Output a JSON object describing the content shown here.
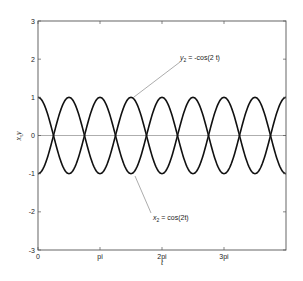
{
  "chart_data": {
    "type": "line",
    "title": "",
    "xlabel": "t",
    "ylabel": "x,y",
    "xlim": [
      0,
      12.566
    ],
    "ylim": [
      -3,
      3
    ],
    "grid": false,
    "legend": null,
    "x_ticks": [
      {
        "value": 0,
        "label": "0"
      },
      {
        "value": 3.1416,
        "label": "pi"
      },
      {
        "value": 6.2832,
        "label": "2pi"
      },
      {
        "value": 9.4248,
        "label": "3pi"
      }
    ],
    "y_ticks": [
      {
        "value": 3,
        "label": "3"
      },
      {
        "value": 2,
        "label": "2"
      },
      {
        "value": 1,
        "label": "1"
      },
      {
        "value": 0,
        "label": "0"
      },
      {
        "value": -1,
        "label": "-1"
      },
      {
        "value": -2,
        "label": "-2"
      },
      {
        "value": -3,
        "label": "-3"
      }
    ],
    "series": [
      {
        "name": "x2 = cos(2t)",
        "function": "cos(2t)",
        "x_start": 0,
        "x_end": 12.566,
        "samples": 400,
        "sign": 1,
        "color": "#111111"
      },
      {
        "name": "y2 = -cos(2 t)",
        "function": "-cos(2t)",
        "x_start": 0,
        "x_end": 12.566,
        "samples": 400,
        "sign": -1,
        "color": "#111111"
      }
    ],
    "reference_lines": [
      {
        "axis": "y",
        "value": 0,
        "color": "#999999"
      }
    ],
    "annotations": [
      {
        "text_main": "y",
        "text_sub": "2",
        "text_rest": " = -cos(2 t)",
        "label_px": [
          180,
          60
        ],
        "arrow_from_px": [
          180,
          62
        ],
        "arrow_to_px": [
          134,
          97
        ]
      },
      {
        "text_main": "x",
        "text_sub": "2",
        "text_rest": " = cos(2t)",
        "label_px": [
          153,
          220
        ],
        "arrow_from_px": [
          151,
          213
        ],
        "arrow_to_px": [
          135,
          176
        ]
      }
    ]
  },
  "layout": {
    "plot_left": 38,
    "plot_top": 21,
    "plot_right": 286,
    "plot_bottom": 250
  }
}
